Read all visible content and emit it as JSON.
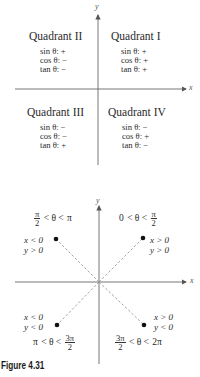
{
  "figure_top": {
    "axis_labels": {
      "x": "x",
      "y": "y"
    },
    "quadrants": [
      {
        "name": "Quadrant II",
        "signs": [
          "sin θ: +",
          "cos θ: −",
          "tan θ: −"
        ]
      },
      {
        "name": "Quadrant I",
        "signs": [
          "sin θ: +",
          "cos θ: +",
          "tan θ: +"
        ]
      },
      {
        "name": "Quadrant III",
        "signs": [
          "sin θ: −",
          "cos θ: −",
          "tan θ: +"
        ]
      },
      {
        "name": "Quadrant IV",
        "signs": [
          "sin θ: −",
          "cos θ: +",
          "tan θ: −"
        ]
      }
    ]
  },
  "figure_bottom": {
    "axis_labels": {
      "x": "x",
      "y": "y"
    },
    "regions": [
      {
        "quadrant": "II",
        "range_left": "π",
        "range_left_den": "2",
        "range_mid": " < θ < ",
        "range_right": "π",
        "cond_x": "x < 0",
        "cond_y": "y > 0"
      },
      {
        "quadrant": "I",
        "range_left": "0",
        "range_mid": " < θ < ",
        "range_right_num": "π",
        "range_right_den": "2",
        "cond_x": "x > 0",
        "cond_y": "y > 0"
      },
      {
        "quadrant": "III",
        "range_left": "π",
        "range_mid": " < θ < ",
        "range_right_num": "3π",
        "range_right_den": "2",
        "cond_x": "x < 0",
        "cond_y": "y < 0"
      },
      {
        "quadrant": "IV",
        "range_left_num": "3π",
        "range_left_den": "2",
        "range_mid": " < θ < ",
        "range_right": "2π",
        "cond_x": "x > 0",
        "cond_y": "y < 0"
      }
    ]
  },
  "caption": "Figure 4.31"
}
